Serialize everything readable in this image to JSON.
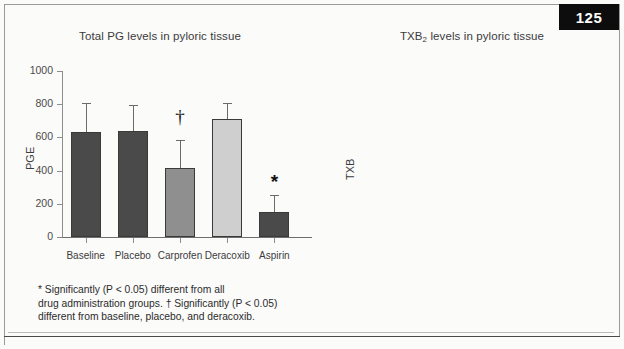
{
  "page": {
    "number_badge": "125"
  },
  "charts": [
    {
      "id": "pg-chart",
      "title": "Total PG levels in pyloric tissue",
      "title_sub": "",
      "ylabel": "PGE",
      "footnote": "* Significantly (P < 0.05) different from all\ndrug administration groups. † Significantly (P < 0.05)\ndifferent from baseline, placebo, and deracoxib.",
      "chart_data": {
        "type": "bar",
        "title": "Total PG levels in pyloric tissue",
        "xlabel": "",
        "ylabel": "PGE",
        "ylim": [
          0,
          1000
        ],
        "yticks": [
          0,
          200,
          400,
          600,
          800,
          1000
        ],
        "grid": false,
        "legend": "none",
        "categories": [
          "Baseline",
          "Placebo",
          "Carprofen",
          "Deracoxib",
          "Aspirin"
        ],
        "values": [
          632,
          640,
          415,
          712,
          150
        ],
        "errors_upper": [
          175,
          155,
          170,
          95,
          105
        ],
        "colors": [
          "#4a4a4a",
          "#4a4a4a",
          "#8f8f8f",
          "#cfcfcf",
          "#4a4a4a"
        ],
        "annotations": [
          {
            "category": "Carprofen",
            "symbol": "†",
            "value_y": 720
          },
          {
            "category": "Aspirin",
            "symbol": "*",
            "value_y": 330
          }
        ]
      }
    },
    {
      "id": "txb-chart",
      "title": "TXB",
      "title_sub": "2",
      "title_rest": " levels in pyloric tissue",
      "ylabel": "TXB",
      "footnote": "* Significantly (P < 0.05) different from all\ndrug administration groups. † Significantly\n(P < 0.05) different from deracoxib.",
      "chart_data": {
        "type": "bar",
        "title": "TXB2 levels in pyloric tissue",
        "xlabel": "",
        "ylabel": "TXB",
        "ylim": [
          0,
          1000
        ],
        "yticks": [
          0,
          200,
          400,
          600,
          800,
          1000
        ],
        "grid": false,
        "legend": "none",
        "categories": [
          "Baseline",
          "Placebo",
          "Carprofen",
          "Deracoxib",
          "Aspirin"
        ],
        "values": [
          608,
          705,
          450,
          793,
          45
        ],
        "errors_upper": [
          250,
          185,
          150,
          110,
          40
        ],
        "colors": [
          "#4a4a4a",
          "#4a4a4a",
          "#8f8f8f",
          "#cfcfcf",
          "#4a4a4a"
        ],
        "annotations": [
          {
            "category": "Carprofen",
            "symbol": "†",
            "value_y": 830
          },
          {
            "category": "Aspirin",
            "symbol": "*",
            "value_y": 215
          }
        ]
      }
    }
  ]
}
